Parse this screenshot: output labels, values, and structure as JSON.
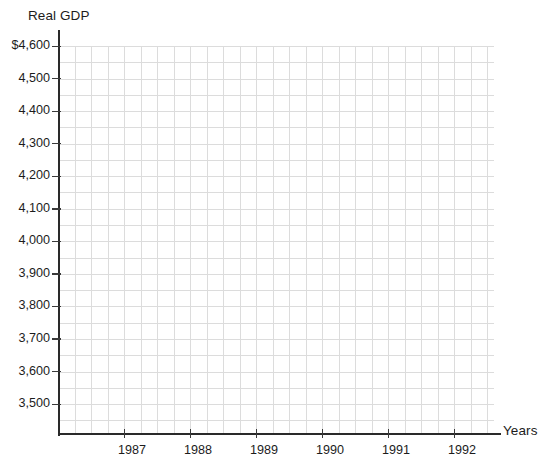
{
  "chart_data": {
    "type": "line",
    "title": "",
    "ylabel": "Real GDP",
    "xlabel": "Years",
    "grid": true,
    "legend": "none",
    "series": [],
    "x": [],
    "y_ticks": [
      {
        "value": 4600,
        "label": "$4,600"
      },
      {
        "value": 4500,
        "label": "4,500"
      },
      {
        "value": 4400,
        "label": "4,400"
      },
      {
        "value": 4300,
        "label": "4,300"
      },
      {
        "value": 4200,
        "label": "4,200"
      },
      {
        "value": 4100,
        "label": "4,100"
      },
      {
        "value": 4000,
        "label": "4,000"
      },
      {
        "value": 3900,
        "label": "3,900"
      },
      {
        "value": 3800,
        "label": "3,800"
      },
      {
        "value": 3700,
        "label": "3,700"
      },
      {
        "value": 3600,
        "label": "3,600"
      },
      {
        "value": 3500,
        "label": "3,500"
      }
    ],
    "x_ticks": [
      {
        "value": 1987,
        "label": "1987"
      },
      {
        "value": 1988,
        "label": "1988"
      },
      {
        "value": 1989,
        "label": "1989"
      },
      {
        "value": 1990,
        "label": "1990"
      },
      {
        "value": 1991,
        "label": "1991"
      },
      {
        "value": 1992,
        "label": "1992"
      }
    ],
    "ylim": [
      3430,
      4600
    ],
    "xlim": [
      1986.0,
      1992.6
    ],
    "values": [],
    "categories": []
  },
  "axes": {
    "y_title": "Real GDP",
    "x_title": "Years"
  }
}
